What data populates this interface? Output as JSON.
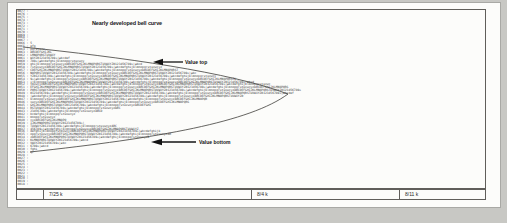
{
  "figure": {
    "title": "Nearly developed bell curve",
    "value_top_label": "Value top",
    "value_bottom_label": "Value bottom"
  },
  "footer": {
    "cells": [
      "",
      "7/25 k",
      "8/4 k",
      "8/11 k"
    ]
  },
  "histogram": {
    "separator": " : ",
    "charset": "abcdefghijklmnopqrstuvwxyzABCDEFGHIJKLMNOPQRSTUVWXYZ0123456789+|"
  },
  "colors": {
    "surround_gray": "#c8c8c4",
    "page_white": "#fcfcfa",
    "line_gray": "#605e5a",
    "ink_black": "#161616",
    "tpo_text": "#3a3a3a"
  },
  "chart_data": {
    "type": "bar",
    "orientation": "horizontal",
    "title": "Nearly developed bell curve",
    "xlabel": "",
    "ylabel": "price (4-digit scale values, descending)",
    "categories": [
      "0077",
      "0076",
      "0075",
      "0074",
      "0073",
      "0072",
      "0071",
      "0070",
      "0069",
      "0068",
      "0067",
      "0066",
      "0065",
      "0064",
      "0063",
      "0062",
      "0061",
      "0060",
      "0059",
      "0058",
      "0057",
      "0056",
      "0055",
      "0054",
      "0053",
      "0052",
      "0051",
      "0050",
      "0049",
      "0048",
      "0047",
      "0046",
      "0045",
      "0044",
      "0043",
      "0042",
      "0041",
      "0040",
      "0039",
      "0038",
      "0037",
      "0036",
      "0035",
      "0034",
      "0033",
      "0032",
      "0031",
      "0030",
      "0029",
      "0028",
      "0027",
      "0026",
      "0025",
      "0024",
      "0023",
      "0022",
      "0021",
      "0020",
      "0019",
      "0018"
    ],
    "values": [
      0,
      0,
      0,
      0,
      0,
      0,
      0,
      0,
      0,
      0,
      0,
      1,
      3,
      8,
      12,
      14,
      22,
      30,
      62,
      73,
      82,
      92,
      103,
      114,
      124,
      133,
      143,
      150,
      146,
      118,
      98,
      88,
      67,
      50,
      40,
      25,
      14,
      20,
      30,
      48,
      60,
      72,
      78,
      66,
      32,
      20,
      10,
      4,
      2,
      0,
      0,
      0,
      0,
      0,
      0,
      0,
      0,
      0,
      0,
      0
    ],
    "values_note": "bar length = approximate count of TPO letter characters per price row, estimated from pixels",
    "annotations": [
      {
        "label": "Value top",
        "category": "0060"
      },
      {
        "label": "Value bottom",
        "category": "0033"
      }
    ],
    "overlay": "smooth sideways bell-curve envelope drawn over the letter profile",
    "footer_ticks": [
      "7/25 k",
      "8/4 k",
      "8/11 k"
    ],
    "legend": "none",
    "grid": "off"
  }
}
